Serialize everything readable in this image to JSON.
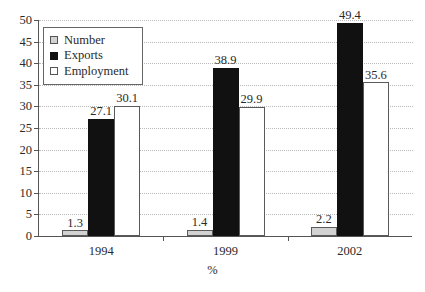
{
  "chart_data": {
    "type": "bar",
    "title": "",
    "subtitle": "",
    "xlabel": "%",
    "ylabel": "",
    "categories": [
      "1994",
      "1999",
      "2002"
    ],
    "series": [
      {
        "name": "Number",
        "color": "#d2d2d2",
        "values": [
          1.3,
          1.4,
          2.2
        ]
      },
      {
        "name": "Exports",
        "color": "#111111",
        "values": [
          27.1,
          38.9,
          49.4
        ]
      },
      {
        "name": "Employment",
        "color": "#ffffff",
        "values": [
          30.1,
          29.9,
          35.6
        ]
      }
    ],
    "ylim": [
      0,
      50
    ],
    "yticks": [
      0,
      5,
      10,
      15,
      20,
      25,
      30,
      35,
      40,
      45,
      50
    ],
    "ytick_labels": [
      "0",
      "5",
      "10",
      "15",
      "20",
      "25",
      "30",
      "35",
      "40",
      "45",
      "50"
    ],
    "grid": true,
    "grid_axis": "y",
    "grid_style": "dotted",
    "grid_color": "#b9b9b9",
    "legend_position": "top-left",
    "data_labels": true,
    "data_label_values": [
      [
        "1.3",
        "27.1",
        "30.1"
      ],
      [
        "1.4",
        "38.9",
        "29.9"
      ],
      [
        "2.2",
        "49.4",
        "35.6"
      ]
    ]
  },
  "legend": {
    "items": [
      {
        "label": "Number",
        "swatch": "legend-swatch-gray"
      },
      {
        "label": "Exports",
        "swatch": "legend-swatch-black"
      },
      {
        "label": "Employment",
        "swatch": "legend-swatch-white"
      }
    ]
  },
  "axes": {
    "x_title": "%",
    "y_tick_labels": [
      "50",
      "45",
      "40",
      "35",
      "30",
      "25",
      "20",
      "15",
      "10",
      "5",
      "0"
    ],
    "x_tick_labels": [
      "1994",
      "1999",
      "2002"
    ]
  }
}
